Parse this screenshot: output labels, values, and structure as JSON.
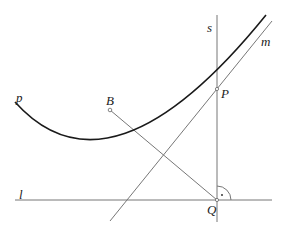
{
  "diagram": {
    "type": "geometry",
    "colors": {
      "curve": "#1a1a1a",
      "line": "#666666",
      "label": "#222222"
    },
    "labels": {
      "s": "s",
      "m": "m",
      "p": "p",
      "B": "B",
      "P": "P",
      "l": "l",
      "Q": "Q"
    },
    "points": {
      "P": {
        "x": 217,
        "y": 89
      },
      "B": {
        "x": 110,
        "y": 110
      },
      "Q": {
        "x": 217,
        "y": 200
      }
    },
    "elements": [
      {
        "name": "parabola",
        "label": "p",
        "kind": "curve"
      },
      {
        "name": "directrix",
        "label": "l",
        "kind": "line"
      },
      {
        "name": "perpendicular",
        "label": "s",
        "kind": "line"
      },
      {
        "name": "tangent",
        "label": "m",
        "kind": "line"
      },
      {
        "name": "segment-BQ",
        "kind": "segment"
      },
      {
        "name": "right-angle-marker",
        "at": "Q"
      }
    ]
  }
}
